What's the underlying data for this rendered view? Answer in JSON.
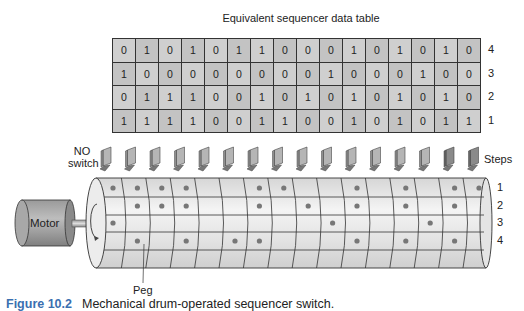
{
  "title": "Equivalent sequencer data table",
  "table": {
    "rows": [
      {
        "label": "4",
        "values": [
          0,
          1,
          0,
          1,
          0,
          1,
          1,
          0,
          0,
          0,
          1,
          0,
          1,
          0,
          1,
          0
        ]
      },
      {
        "label": "3",
        "values": [
          1,
          0,
          0,
          0,
          0,
          0,
          0,
          0,
          0,
          1,
          0,
          0,
          0,
          1,
          0,
          0
        ]
      },
      {
        "label": "2",
        "values": [
          0,
          1,
          1,
          1,
          0,
          0,
          1,
          0,
          1,
          0,
          1,
          0,
          1,
          0,
          1,
          0
        ]
      },
      {
        "label": "1",
        "values": [
          1,
          1,
          1,
          1,
          0,
          0,
          1,
          1,
          0,
          0,
          1,
          0,
          1,
          0,
          1,
          1
        ]
      }
    ]
  },
  "diagram": {
    "switch_label_line1": "NO",
    "switch_label_line2": "switch",
    "steps_label": "Steps",
    "motor_label": "Motor",
    "peg_label": "Peg",
    "track_labels": [
      "1",
      "2",
      "3",
      "4"
    ],
    "switch_count": 16
  },
  "caption": {
    "figure": "Figure 10.2",
    "text": "Mechanical drum-operated sequencer switch."
  }
}
